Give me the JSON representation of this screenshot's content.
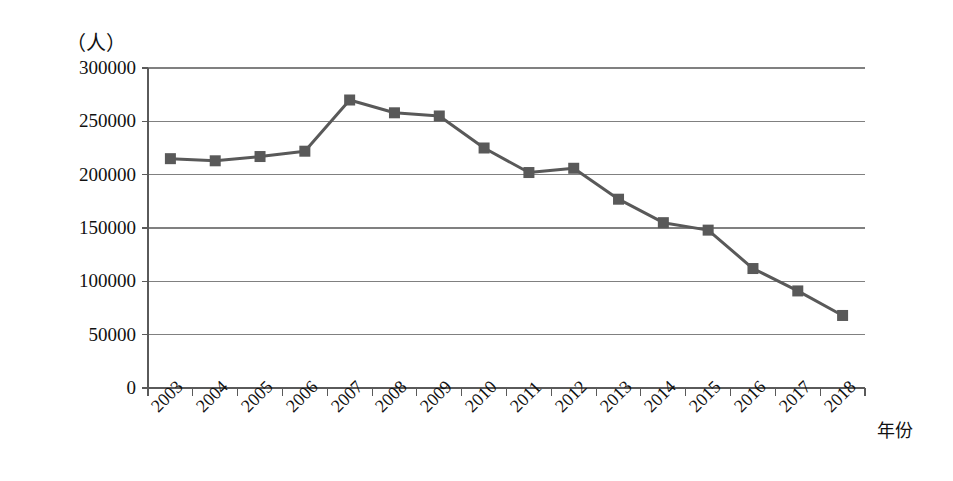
{
  "chart_data": {
    "type": "line",
    "title": "",
    "subtitle": "",
    "unit_label": "（人）",
    "xlabel": "年份",
    "ylabel": "",
    "categories": [
      "2003",
      "2004",
      "2005",
      "2006",
      "2007",
      "2008",
      "2009",
      "2010",
      "2011",
      "2012",
      "2013",
      "2014",
      "2015",
      "2016",
      "2017",
      "2018"
    ],
    "values": [
      215000,
      213000,
      217000,
      222000,
      270000,
      258000,
      255000,
      225000,
      202000,
      206000,
      177000,
      155000,
      148000,
      112000,
      91000,
      68000
    ],
    "series": [
      {
        "name": "人数",
        "values": [
          215000,
          213000,
          217000,
          222000,
          270000,
          258000,
          255000,
          225000,
          202000,
          206000,
          177000,
          155000,
          148000,
          112000,
          91000,
          68000
        ]
      }
    ],
    "ylim": [
      0,
      300000
    ],
    "yticks": [
      0,
      50000,
      100000,
      150000,
      200000,
      250000,
      300000
    ],
    "ytick_labels": [
      "0",
      "50000",
      "100000",
      "150000",
      "200000",
      "250000",
      "300000"
    ],
    "grid": true,
    "grid_axis": "y",
    "legend": "none",
    "marker": "square",
    "series_color": "#595959",
    "grid_color": "#808080",
    "axis_color": "#5a5a5a"
  }
}
